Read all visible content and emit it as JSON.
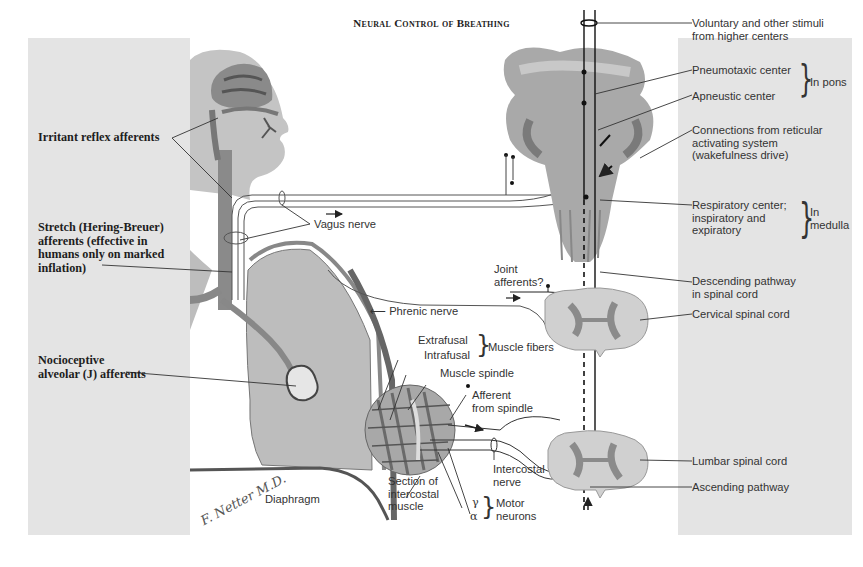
{
  "title": "Neural Control of Breathing",
  "colors": {
    "panel_gray": "#e4e4e4",
    "tissue_gray": "#b9b9b9",
    "tissue_dark": "#6e6e6e",
    "nerve_line": "#333333"
  },
  "left_labels": {
    "irritant": "Irritant reflex afferents",
    "stretch": [
      "Stretch (Hering-Breuer)",
      "afferents (effective in",
      "humans only on marked",
      "inflation)"
    ],
    "nocioceptive": [
      "Nocioceptive",
      "alveolar (J) afferents"
    ]
  },
  "center_labels": {
    "vagus": "Vagus nerve",
    "phrenic": "Phrenic nerve",
    "joint": [
      "Joint",
      "afferents?"
    ],
    "extrafusal": "Extrafusal",
    "intrafusal": "Intrafusal",
    "muscle_fibers": "Muscle fibers",
    "muscle_spindle": "Muscle spindle",
    "afferent_spindle": [
      "Afferent",
      "from spindle"
    ],
    "section": [
      "Section of",
      "intercostal",
      "muscle"
    ],
    "intercostal_nerve": [
      "Intercostal",
      "nerve"
    ],
    "gamma": "γ",
    "alpha": "α",
    "motor_neurons": [
      "Motor",
      "neurons"
    ],
    "diaphragm": "Diaphragm",
    "signature": "F. Netter M.D."
  },
  "right_labels": {
    "voluntary": [
      "Voluntary and other stimuli",
      "from higher centers"
    ],
    "pneumotaxic": "Pneumotaxic center",
    "apneustic": "Apneustic center",
    "in_pons": "In pons",
    "connections": [
      "Connections from reticular",
      "activating system",
      "(wakefulness drive)"
    ],
    "respiratory": [
      "Respiratory center;",
      "inspiratory and",
      "expiratory"
    ],
    "in_medulla": [
      "In",
      "medulla"
    ],
    "descending": [
      "Descending pathway",
      "in spinal cord"
    ],
    "cervical": "Cervical spinal cord",
    "lumbar": "Lumbar spinal cord",
    "ascending": "Ascending pathway"
  }
}
